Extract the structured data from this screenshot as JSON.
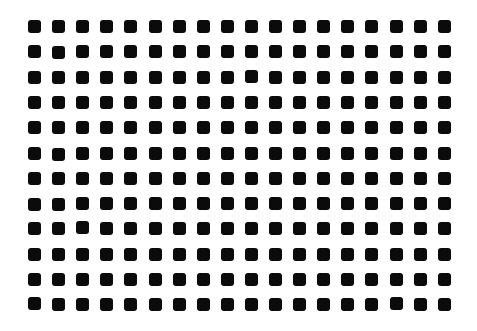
{
  "canvas": {
    "width": 477,
    "height": 331,
    "background": "#ffffff"
  },
  "grid": {
    "columns": 18,
    "rows": 12,
    "origin_x": 28,
    "origin_y": 20,
    "pitch_x": 24.1,
    "pitch_y": 25.3,
    "square_size": 13,
    "corner_radius": 3,
    "color": "#0b0b0b",
    "jitter": [
      [
        0,
        0,
        0,
        0,
        0,
        0,
        0,
        0,
        0,
        0,
        0,
        0,
        0,
        0,
        0,
        0,
        0,
        0
      ],
      [
        0,
        1,
        0,
        0,
        0,
        0,
        0,
        0,
        0,
        0,
        0,
        0,
        0,
        0,
        0,
        0,
        0,
        0
      ],
      [
        0,
        0,
        0,
        0,
        0,
        0,
        0,
        0,
        0,
        -1,
        0,
        0,
        0,
        0,
        0,
        0,
        0,
        0
      ],
      [
        0,
        0,
        0,
        0,
        0,
        0,
        0,
        0,
        0,
        0,
        0,
        0,
        0,
        0,
        0,
        0,
        0,
        0
      ],
      [
        0,
        0,
        0,
        0,
        0,
        0,
        0,
        0,
        0,
        0,
        0,
        0,
        0,
        0,
        0,
        0,
        0,
        0
      ],
      [
        0,
        1,
        0,
        0,
        0,
        0,
        0,
        0,
        0,
        0,
        0,
        0,
        0,
        0,
        0,
        0,
        0,
        0
      ],
      [
        0,
        0,
        0,
        0,
        0,
        0,
        0,
        0,
        0,
        0,
        0,
        0,
        0,
        0,
        0,
        0,
        0,
        0
      ],
      [
        1,
        1,
        0,
        0,
        0,
        0,
        0,
        0,
        0,
        0,
        0,
        0,
        0,
        0,
        0,
        0,
        0,
        0
      ],
      [
        0,
        0,
        -1,
        0,
        0,
        0,
        0,
        0,
        0,
        0,
        0,
        0,
        0,
        0,
        0,
        0,
        0,
        0
      ],
      [
        0,
        0,
        0,
        0,
        0,
        0,
        0,
        0,
        0,
        0,
        0,
        0,
        0,
        0,
        0,
        0,
        0,
        0
      ],
      [
        0,
        0,
        0,
        0,
        0,
        0,
        0,
        0,
        0,
        0,
        0,
        0,
        0,
        0,
        0,
        0,
        0,
        0
      ],
      [
        -1,
        0,
        0,
        0,
        0,
        0,
        0,
        0,
        0,
        0,
        0,
        0,
        0,
        0,
        0,
        -1,
        0,
        0
      ]
    ]
  }
}
